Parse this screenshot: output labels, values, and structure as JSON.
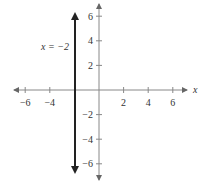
{
  "chart_data": {
    "type": "line",
    "title": "",
    "xlabel": "x",
    "ylabel": "",
    "xlim": [
      -7.5,
      7.5
    ],
    "ylim": [
      -7.5,
      7.5
    ],
    "x_ticks": [
      -6,
      -4,
      2,
      4,
      6
    ],
    "x_tick_labels": [
      "−6",
      "−4",
      "2",
      "4",
      "6"
    ],
    "y_ticks": [
      6,
      4,
      2,
      -2,
      -4,
      -6
    ],
    "y_tick_labels": [
      "6",
      "4",
      "2",
      "−2",
      "−4",
      "−6"
    ],
    "grid": false,
    "series": [
      {
        "name": "x = −2",
        "equation": "x = -2",
        "x": [
          -2,
          -2
        ],
        "y": [
          -6.5,
          6.5
        ],
        "arrows_both_ends": true
      }
    ],
    "annotations": [
      {
        "text": "x = −2",
        "x": -5,
        "y": 5
      }
    ]
  },
  "labels": {
    "x_axis": "x",
    "line_label": "x = −2"
  },
  "colors": {
    "axis": "#888888",
    "line": "#222222",
    "text": "#333333"
  }
}
